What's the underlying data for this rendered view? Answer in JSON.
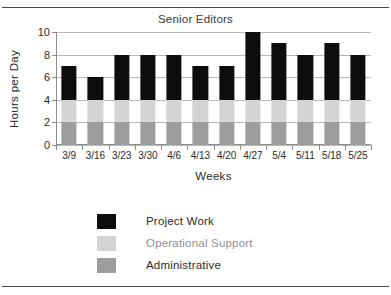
{
  "figure": {
    "clipped_title_above_rule": "",
    "title": "Senior Editors"
  },
  "axes": {
    "ylabel": "Hours per Day",
    "xlabel": "Weeks",
    "yticks": [
      "0",
      "2",
      "4",
      "6",
      "8",
      "10"
    ]
  },
  "legend": {
    "entries": [
      {
        "label": "Project Work",
        "color": "#0d0d0d"
      },
      {
        "label": "Operational Support",
        "color": "#d4d4d4"
      },
      {
        "label": "Administrative",
        "color": "#9d9d9d"
      }
    ]
  },
  "chart_data": {
    "type": "bar",
    "subtype": "stacked",
    "title": "Senior Editors",
    "xlabel": "Weeks",
    "ylabel": "Hours per Day",
    "ylim": [
      0,
      10
    ],
    "ytick_values": [
      0,
      2,
      4,
      6,
      8,
      10
    ],
    "grid": true,
    "legend_position": "below-plot-center",
    "categories": [
      "3/9",
      "3/16",
      "3/23",
      "3/30",
      "4/6",
      "4/13",
      "4/20",
      "4/27",
      "5/4",
      "5/11",
      "5/18",
      "5/25"
    ],
    "series": [
      {
        "name": "Administrative",
        "color": "#9d9d9d",
        "values": [
          2,
          2,
          2,
          2,
          2,
          2,
          2,
          2,
          2,
          2,
          2,
          2
        ]
      },
      {
        "name": "Operational Support",
        "color": "#d4d4d4",
        "values": [
          2,
          2,
          2,
          2,
          2,
          2,
          2,
          2,
          2,
          2,
          2,
          2
        ]
      },
      {
        "name": "Project Work",
        "color": "#0d0d0d",
        "values": [
          3,
          2,
          4,
          4,
          4,
          3,
          3,
          6,
          5,
          4,
          5,
          4
        ]
      }
    ],
    "totals": [
      7,
      6,
      8,
      8,
      8,
      7,
      7,
      10,
      9,
      8,
      9,
      8
    ]
  }
}
